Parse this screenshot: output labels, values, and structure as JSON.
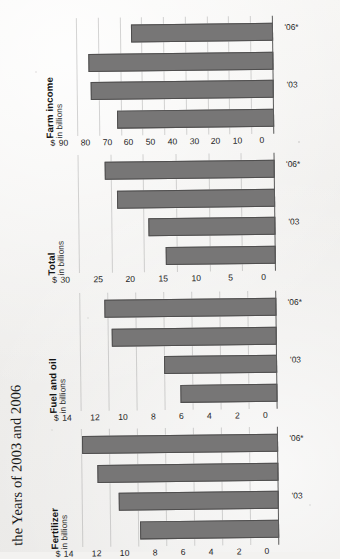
{
  "figure": {
    "title": "the Years of 2003 and 2006",
    "bar_color": "#777676",
    "background_color": "#f3f2f0"
  },
  "chart_data": [
    {
      "type": "bar",
      "title": "Fertilizer",
      "subtitle": "in billions",
      "unit_symbol": "$",
      "categories": [
        "",
        "'03",
        "",
        "'06*"
      ],
      "values": [
        9.9,
        11.4,
        12.9,
        14.0
      ],
      "xlabel": "",
      "ylabel": "in billions",
      "ylim": [
        0,
        14
      ],
      "yticks": [
        0,
        2,
        4,
        6,
        8,
        10,
        12,
        14
      ],
      "ytick_labels": [
        "0",
        "2",
        "4",
        "6",
        "8",
        "10",
        "12",
        "14"
      ],
      "grid": true,
      "legend": "none"
    },
    {
      "type": "bar",
      "title": "Fuel and oil",
      "subtitle": "in billions",
      "unit_symbol": "$",
      "categories": [
        "",
        "'03",
        "",
        "'06*"
      ],
      "values": [
        6.9,
        8.1,
        11.8,
        12.3
      ],
      "xlabel": "",
      "ylabel": "in billions",
      "ylim": [
        0,
        14
      ],
      "yticks": [
        0,
        2,
        4,
        6,
        8,
        10,
        12,
        14
      ],
      "ytick_labels": [
        "0",
        "2",
        "4",
        "6",
        "8",
        "10",
        "12",
        "14"
      ],
      "grid": true,
      "legend": "none"
    },
    {
      "type": "bar",
      "title": "Total",
      "subtitle": "in billions",
      "unit_symbol": "$",
      "categories": [
        "",
        "'03",
        "",
        "'06*"
      ],
      "values": [
        16.9,
        19.5,
        24.2,
        26.0
      ],
      "xlabel": "",
      "ylabel": "in billions",
      "ylim": [
        0,
        30
      ],
      "yticks": [
        0,
        5,
        10,
        15,
        20,
        25,
        30
      ],
      "ytick_labels": [
        "0",
        "5",
        "10",
        "15",
        "20",
        "25",
        "30"
      ],
      "grid": true,
      "legend": "none"
    },
    {
      "type": "bar",
      "title": "Farm income",
      "subtitle": "in billions",
      "unit_symbol": "$",
      "categories": [
        "",
        "'03",
        "",
        "'06*"
      ],
      "values": [
        72,
        84,
        85,
        65
      ],
      "xlabel": "",
      "ylabel": "in billions",
      "ylim": [
        0,
        90
      ],
      "yticks": [
        0,
        10,
        20,
        30,
        40,
        50,
        60,
        70,
        80,
        90
      ],
      "ytick_labels": [
        "0",
        "10",
        "20",
        "30",
        "40",
        "50",
        "60",
        "70",
        "80",
        "90"
      ],
      "grid": true,
      "legend": "none"
    }
  ]
}
